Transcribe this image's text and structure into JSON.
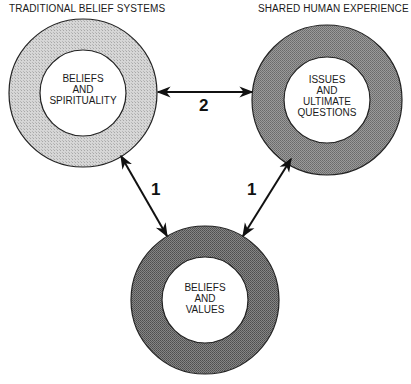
{
  "headings": {
    "left": "TRADITIONAL BELIEF SYSTEMS",
    "right": "SHARED HUMAN EXPERIENCE"
  },
  "nodes": [
    {
      "id": "left",
      "label": "BELIEFS\nAND\nSPIRITUALITY",
      "fill": "#c8c8c8"
    },
    {
      "id": "right",
      "label": "ISSUES\nAND\nULTIMATE\nQUESTIONS",
      "fill": "#8a8a8a"
    },
    {
      "id": "bottom",
      "label": "BELIEFS\nAND\nVALUES",
      "fill": "#6e6e6e"
    }
  ],
  "edges": [
    {
      "from": "left",
      "to": "right",
      "label": "2"
    },
    {
      "from": "left",
      "to": "bottom",
      "label": "1"
    },
    {
      "from": "right",
      "to": "bottom",
      "label": "1"
    }
  ]
}
